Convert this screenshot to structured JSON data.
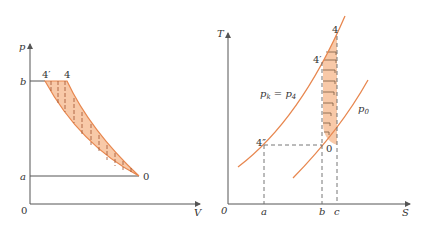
{
  "colors": {
    "curve": "#e8874f",
    "fill": "#f8c9a8",
    "axis": "#555555",
    "hatch": "#a0522d",
    "dash": "#666666",
    "text": "#333333"
  },
  "pv_diagram": {
    "y_axis_label": "p",
    "x_axis_label": "V",
    "origin_label": "0",
    "y_tick_b": "b",
    "y_tick_a": "a",
    "point_4prime": "4′",
    "point_4": "4",
    "point_0": "0"
  },
  "ts_diagram": {
    "y_axis_label": "T",
    "x_axis_label": "S",
    "origin_label": "0",
    "x_tick_a": "a",
    "x_tick_b": "b",
    "x_tick_c": "c",
    "point_4": "4",
    "point_4prime": "4′",
    "point_4dblprime": "4″",
    "point_0": "0",
    "isobar_high_label_main": "p",
    "isobar_high_label_sub1": "k",
    "isobar_high_label_eq": " = p",
    "isobar_high_label_sub2": "4",
    "isobar_low_label_main": "p",
    "isobar_low_label_sub": "0"
  }
}
